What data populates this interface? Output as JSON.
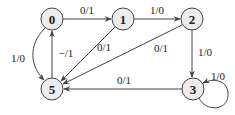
{
  "diagram": {
    "type": "state-machine",
    "node_fill": "#ececec",
    "stroke": "#444444",
    "nodes": [
      {
        "id": "0",
        "label": "0",
        "x": 52,
        "y": 19
      },
      {
        "id": "1",
        "label": "1",
        "x": 123,
        "y": 19
      },
      {
        "id": "2",
        "label": "2",
        "x": 192,
        "y": 19
      },
      {
        "id": "3",
        "label": "3",
        "x": 193,
        "y": 89
      },
      {
        "id": "5",
        "label": "5",
        "x": 52,
        "y": 89
      }
    ],
    "edges": [
      {
        "from": "0",
        "to": "1",
        "label": "0/1"
      },
      {
        "from": "1",
        "to": "2",
        "label": "1/0"
      },
      {
        "from": "1",
        "to": "5",
        "label": "0/1"
      },
      {
        "from": "2",
        "to": "5",
        "label": "0/1"
      },
      {
        "from": "2",
        "to": "3",
        "label": "1/0"
      },
      {
        "from": "3",
        "to": "3",
        "label": "1/0"
      },
      {
        "from": "3",
        "to": "5",
        "label": "0/1"
      },
      {
        "from": "0",
        "to": "5",
        "label": "1/0"
      },
      {
        "from": "5",
        "to": "0",
        "label": "−/1"
      }
    ]
  }
}
